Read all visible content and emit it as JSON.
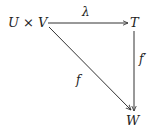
{
  "diagram": {
    "type": "commutative-diagram",
    "nodes": {
      "source": {
        "label": "U × V"
      },
      "top_right": {
        "label": "T"
      },
      "bottom_right": {
        "label": "W"
      }
    },
    "edges": {
      "lambda": {
        "label": "λ",
        "from": "U × V",
        "to": "T"
      },
      "f_prime": {
        "label": "f′",
        "from": "T",
        "to": "W"
      },
      "f": {
        "label": "f",
        "from": "U × V",
        "to": "W"
      }
    },
    "colors": {
      "stroke": "#333333",
      "text": "#222222",
      "background": "#ffffff"
    }
  }
}
